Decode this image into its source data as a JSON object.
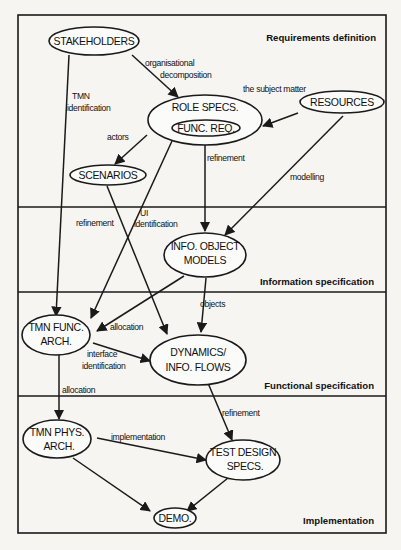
{
  "diagram": {
    "bands": [
      {
        "id": "requirements",
        "label": "Requirements definition"
      },
      {
        "id": "information",
        "label": "Information specification"
      },
      {
        "id": "functional",
        "label": "Functional specification"
      },
      {
        "id": "implementation",
        "label": "Implementation"
      }
    ],
    "nodes": [
      {
        "id": "stakeholders",
        "lines": [
          "STAKEHOLDERS"
        ]
      },
      {
        "id": "role-specs",
        "lines": [
          "ROLE SPECS."
        ]
      },
      {
        "id": "func-req",
        "lines": [
          "FUNC. REQ."
        ]
      },
      {
        "id": "resources",
        "lines": [
          "RESOURCES"
        ]
      },
      {
        "id": "scenarios",
        "lines": [
          "SCENARIOS"
        ]
      },
      {
        "id": "info-object-models",
        "lines": [
          "INFO. OBJECT",
          "MODELS"
        ]
      },
      {
        "id": "tmn-func-arch",
        "lines": [
          "TMN FUNC.",
          "ARCH."
        ]
      },
      {
        "id": "dynamics-info-flows",
        "lines": [
          "DYNAMICS/",
          "INFO. FLOWS"
        ]
      },
      {
        "id": "tmn-phys-arch",
        "lines": [
          "TMN PHYS.",
          "ARCH."
        ]
      },
      {
        "id": "test-design-specs",
        "lines": [
          "TEST DESIGN",
          "SPECS."
        ]
      },
      {
        "id": "demo",
        "lines": [
          "DEMO."
        ]
      }
    ],
    "edges": [
      {
        "id": "stakeholders-to-role-specs",
        "from": "stakeholders",
        "to": "role-specs",
        "label": [
          "organisational",
          "decomposition"
        ]
      },
      {
        "id": "stakeholders-to-tmn-func-arch",
        "from": "stakeholders",
        "to": "tmn-func-arch",
        "label": [
          "TMN",
          "identification"
        ]
      },
      {
        "id": "resources-to-role-specs",
        "from": "resources",
        "to": "role-specs",
        "label": [
          "the subject matter"
        ]
      },
      {
        "id": "resources-to-info-object-models",
        "from": "resources",
        "to": "info-object-models",
        "label": [
          "modelling"
        ]
      },
      {
        "id": "role-specs-to-scenarios",
        "from": "role-specs",
        "to": "scenarios",
        "label": [
          "actors"
        ]
      },
      {
        "id": "role-specs-to-info-object-models",
        "from": "role-specs",
        "to": "info-object-models",
        "label": [
          "refinement"
        ]
      },
      {
        "id": "role-specs-to-tmn-func-arch",
        "from": "role-specs",
        "to": "tmn-func-arch",
        "label": [
          "UI",
          "identification"
        ]
      },
      {
        "id": "scenarios-to-dynamics",
        "from": "scenarios",
        "to": "dynamics-info-flows",
        "label": [
          "refinement"
        ]
      },
      {
        "id": "info-object-models-to-tmn-func-arch",
        "from": "info-object-models",
        "to": "tmn-func-arch",
        "label": [
          "allocation"
        ]
      },
      {
        "id": "info-object-models-to-dynamics",
        "from": "info-object-models",
        "to": "dynamics-info-flows",
        "label": [
          "objects"
        ]
      },
      {
        "id": "tmn-func-arch-to-dynamics",
        "from": "tmn-func-arch",
        "to": "dynamics-info-flows",
        "label": [
          "interface",
          "identification"
        ]
      },
      {
        "id": "tmn-func-arch-to-tmn-phys-arch",
        "from": "tmn-func-arch",
        "to": "tmn-phys-arch",
        "label": [
          "allocation"
        ]
      },
      {
        "id": "dynamics-to-test-design",
        "from": "dynamics-info-flows",
        "to": "test-design-specs",
        "label": [
          "refinement"
        ]
      },
      {
        "id": "tmn-phys-arch-to-test-design",
        "from": "tmn-phys-arch",
        "to": "test-design-specs",
        "label": [
          "implementation"
        ]
      },
      {
        "id": "tmn-phys-arch-to-demo",
        "from": "tmn-phys-arch",
        "to": "demo",
        "label": []
      },
      {
        "id": "test-design-to-demo",
        "from": "test-design-specs",
        "to": "demo",
        "label": []
      }
    ]
  },
  "page_header_fragment": "... Stakeholder Identification and Definition"
}
